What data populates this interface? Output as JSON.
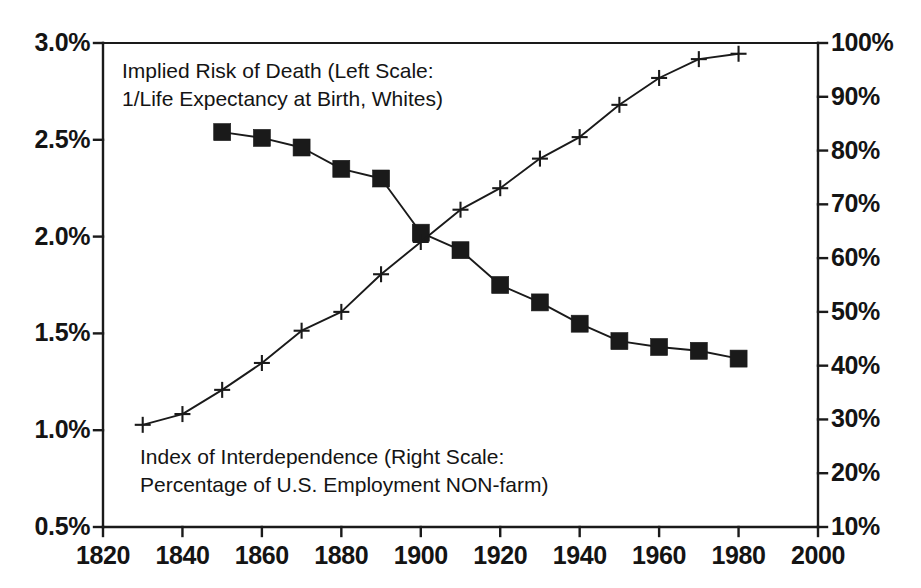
{
  "chart_data": {
    "type": "line",
    "title": "",
    "xlabel": "",
    "x": [
      1830,
      1840,
      1850,
      1860,
      1870,
      1880,
      1890,
      1900,
      1910,
      1920,
      1930,
      1940,
      1950,
      1960,
      1970,
      1980
    ],
    "xlim": [
      1820,
      2000
    ],
    "x_ticks": [
      "1820",
      "1840",
      "1860",
      "1880",
      "1900",
      "1920",
      "1940",
      "1960",
      "1980",
      "2000"
    ],
    "x_tick_values": [
      1820,
      1840,
      1860,
      1880,
      1900,
      1920,
      1940,
      1960,
      1980,
      2000
    ],
    "grid": false,
    "legend_position": "in-plot-annotations",
    "left_axis": {
      "label": "Implied Risk of Death",
      "ylim": [
        0.5,
        3.0
      ],
      "ticks": [
        "0.5%",
        "1.0%",
        "1.5%",
        "2.0%",
        "2.5%",
        "3.0%"
      ],
      "tick_values": [
        0.5,
        1.0,
        1.5,
        2.0,
        2.5,
        3.0
      ]
    },
    "right_axis": {
      "label": "Index of Interdependence",
      "ylim": [
        10,
        100
      ],
      "ticks": [
        "10%",
        "20%",
        "30%",
        "40%",
        "50%",
        "60%",
        "70%",
        "80%",
        "90%",
        "100%"
      ],
      "tick_values": [
        10,
        20,
        30,
        40,
        50,
        60,
        70,
        80,
        90,
        100
      ]
    },
    "series": [
      {
        "name": "Implied Risk of Death (Left Scale: 1/Life Expectancy at Birth, Whites)",
        "axis": "left",
        "marker": "filled-square",
        "color": "#1a1a1a",
        "x": [
          1850,
          1860,
          1870,
          1880,
          1890,
          1900,
          1910,
          1920,
          1930,
          1940,
          1950,
          1960,
          1970,
          1980
        ],
        "values": [
          2.54,
          2.51,
          2.46,
          2.35,
          2.3,
          2.02,
          1.93,
          1.75,
          1.66,
          1.55,
          1.46,
          1.43,
          1.41,
          1.37
        ]
      },
      {
        "name": "Index of Interdependence (Right Scale: Percentage of U.S. Employment NON-farm)",
        "axis": "right",
        "marker": "plus",
        "color": "#1a1a1a",
        "x": [
          1830,
          1840,
          1850,
          1860,
          1870,
          1880,
          1890,
          1900,
          1910,
          1920,
          1930,
          1940,
          1950,
          1960,
          1970,
          1980
        ],
        "values": [
          29.0,
          31.0,
          35.5,
          40.5,
          46.5,
          50.0,
          57.0,
          63.0,
          69.0,
          73.0,
          78.5,
          82.5,
          88.5,
          93.5,
          97.0,
          98.0
        ]
      }
    ],
    "annotations": [
      {
        "id": "death-risk-annotation",
        "lines": [
          "Implied Risk of Death (Left Scale:",
          "1/Life Expectancy at Birth, Whites)"
        ],
        "x_px": 122,
        "y_px": 57
      },
      {
        "id": "interdependence-annotation",
        "lines": [
          "Index of Interdependence (Right Scale:",
          "Percentage of U.S. Employment NON-farm)"
        ],
        "x_px": 140,
        "y_px": 443
      }
    ]
  },
  "colors": {
    "axis": "#1a1a1a",
    "series": "#1a1a1a",
    "background": "#ffffff"
  }
}
